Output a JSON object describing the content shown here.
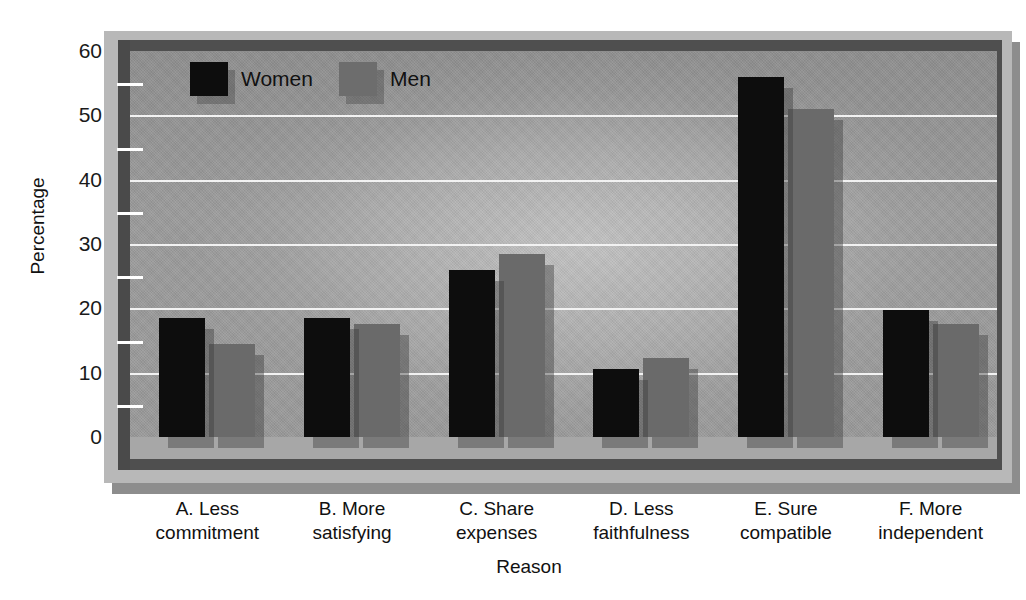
{
  "chart_data": {
    "type": "bar",
    "title": "",
    "xlabel": "Reason",
    "ylabel": "Percentage",
    "ylim": [
      0,
      60
    ],
    "yticks": [
      0,
      10,
      20,
      30,
      40,
      50,
      60
    ],
    "ytick_labels": [
      "0",
      "10",
      "20",
      "30",
      "40",
      "50",
      "60"
    ],
    "minor_tick_step": 5,
    "grid": true,
    "grid_color": "#f2f2f2",
    "legend_position": "top-left-inside",
    "categories": [
      "A. Less commitment",
      "B. More satisfying",
      "C. Share expenses",
      "D. Less faithfulness",
      "E. Sure compatible",
      "F. More independent"
    ],
    "category_lines": [
      [
        "A. Less",
        "commitment"
      ],
      [
        "B. More",
        "satisfying"
      ],
      [
        "C. Share",
        "expenses"
      ],
      [
        "D. Less",
        "faithfulness"
      ],
      [
        "E. Sure",
        "compatible"
      ],
      [
        "F. More",
        "independent"
      ]
    ],
    "series": [
      {
        "name": "Women",
        "color": "#0d0d0d",
        "values": [
          18.5,
          18.5,
          26.0,
          10.5,
          56.0,
          19.7
        ]
      },
      {
        "name": "Men",
        "color": "#6a6a6a",
        "values": [
          14.5,
          17.5,
          28.5,
          12.3,
          51.0,
          17.5
        ]
      }
    ]
  },
  "axes": {
    "y_title": "Percentage",
    "x_title": "Reason"
  },
  "legend": {
    "items": [
      {
        "label": "Women",
        "key": "women"
      },
      {
        "label": "Men",
        "key": "men"
      }
    ]
  },
  "colors": {
    "women_bar": "#0d0d0d",
    "men_bar": "#6a6a6a",
    "plot_background": "#9a9a9a",
    "gridline": "#f2f2f2",
    "frame_light": "#b8b8b8",
    "frame_dark": "#4f4f4f",
    "shadow_plate": "#8d8d8d",
    "text": "#111111"
  }
}
